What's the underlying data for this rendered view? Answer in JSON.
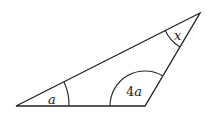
{
  "diagram": {
    "type": "triangle",
    "vertices": {
      "left": [
        16,
        106
      ],
      "bottom_right": [
        145,
        106
      ],
      "top": [
        200,
        13
      ]
    },
    "angles": [
      {
        "id": "left",
        "label": "a"
      },
      {
        "id": "bottom_right",
        "label_prefix": "4",
        "label_var": "a"
      },
      {
        "id": "top",
        "label": "x"
      }
    ],
    "colors": {
      "stroke": "#222222",
      "background": "#ffffff"
    }
  }
}
